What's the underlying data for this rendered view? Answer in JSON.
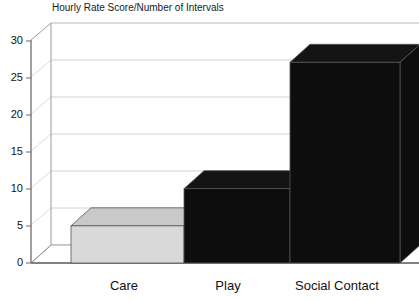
{
  "chart_data": {
    "type": "bar",
    "title": "Hourly Rate Score/Number of Intervals",
    "xlabel": "",
    "ylabel": "",
    "categories": [
      "Care",
      "Play",
      "Social Contact"
    ],
    "values": [
      5,
      10,
      27
    ],
    "series": [
      {
        "name": "Hourly Rate Score/Number of Intervals",
        "values": [
          5,
          10,
          27
        ]
      }
    ],
    "yticks": [
      0,
      5,
      10,
      15,
      20,
      25,
      30
    ],
    "ytick_labels": [
      "0",
      "5",
      "10",
      "15",
      "20",
      "25",
      "30"
    ],
    "ylim": [
      0,
      30
    ],
    "grid": true,
    "grid_axis": "y",
    "legend": false,
    "legend_position": "none",
    "style": "3d-bar",
    "bar_colors": [
      "#d9d9d9",
      "#0d0d0d",
      "#0d0d0d"
    ],
    "bar_top_colors": [
      "#c9c9c9",
      "#141414",
      "#141414"
    ],
    "bar_edge_color": "#555555",
    "axis_color": "#6b6b6b",
    "grid_color": "#d2d2d2",
    "background": "#ffffff",
    "annotations": []
  },
  "axes": {
    "y_axis_name": "value-axis",
    "x_axis_name": "category-axis"
  }
}
